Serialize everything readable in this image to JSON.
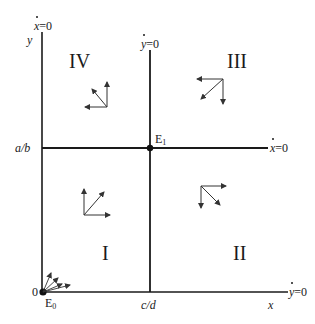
{
  "diagram": {
    "type": "phase-plane",
    "axes": {
      "x_label": "x",
      "y_label": "y",
      "origin_label": "0"
    },
    "ticks": {
      "x_tick": "c/d",
      "y_tick": "a/b"
    },
    "nullclines": {
      "x_dot_vertical": {
        "var": "x",
        "eq": "=0"
      },
      "y_dot_vertical": {
        "var": "y",
        "eq": "=0"
      },
      "x_dot_horizontal": {
        "var": "x",
        "eq": "=0"
      },
      "y_dot_horizontal": {
        "var": "y",
        "eq": "=0"
      }
    },
    "equilibria": {
      "e0": {
        "base": "E",
        "sub": "0"
      },
      "e1": {
        "base": "E",
        "sub": "1"
      }
    },
    "regions": {
      "I": "I",
      "II": "II",
      "III": "III",
      "IV": "IV"
    },
    "colors": {
      "line": "#1a1a1a",
      "arrow": "#333333",
      "background": "#ffffff"
    }
  }
}
